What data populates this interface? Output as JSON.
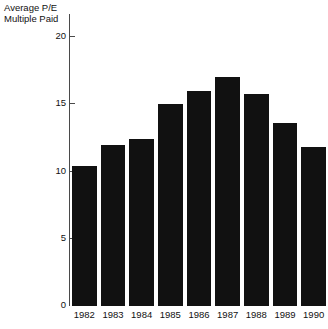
{
  "chart_data": {
    "type": "bar",
    "title": "Average P/E Multiple Paid",
    "title_lines": [
      "Average P/E",
      "Multiple Paid"
    ],
    "xlabel": "",
    "ylabel": "",
    "categories": [
      "1982",
      "1983",
      "1984",
      "1985",
      "1986",
      "1987",
      "1988",
      "1989",
      "1990"
    ],
    "values": [
      10.4,
      12.0,
      12.4,
      15.0,
      16.0,
      17.0,
      15.8,
      13.6,
      11.8
    ],
    "ylim": [
      0,
      20
    ],
    "yticks": [
      0,
      5,
      10,
      15,
      20
    ],
    "ytick_labels": [
      "0",
      "5",
      "10",
      "15",
      "20"
    ],
    "grid": false,
    "legend": false,
    "bar_color": "#111111",
    "axis_color": "#4a4a4a",
    "background_color": "#ffffff"
  }
}
